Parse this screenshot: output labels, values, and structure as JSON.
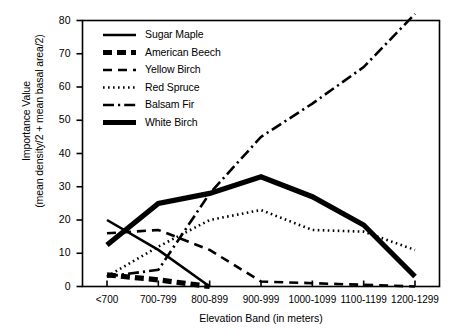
{
  "chart_data": {
    "type": "line",
    "title": "",
    "xlabel": "Elevation Band (in meters)",
    "ylabel_line1": "Importance Value",
    "ylabel_line2": "(mean density/2 + mean basal area/2)",
    "categories": [
      "<700",
      "700-799",
      "800-899",
      "900-999",
      "1000-1099",
      "1100-1199",
      "1200-1299"
    ],
    "ylim": [
      0,
      80
    ],
    "yticks": [
      0,
      10,
      20,
      30,
      40,
      50,
      60,
      70,
      80
    ],
    "grid": false,
    "legend_position": "top-left inside plot",
    "series": [
      {
        "name": "Sugar Maple",
        "style": "solid",
        "color": "#000000",
        "values": [
          20,
          11,
          0,
          null,
          null,
          null,
          null
        ]
      },
      {
        "name": "American Beech",
        "style": "thick-dashed",
        "color": "#000000",
        "values": [
          3.5,
          2,
          0,
          null,
          null,
          null,
          null
        ]
      },
      {
        "name": "Yellow Birch",
        "style": "dashed",
        "color": "#000000",
        "values": [
          16,
          17,
          11,
          1.5,
          1,
          0.5,
          0
        ]
      },
      {
        "name": "Red Spruce",
        "style": "dotted",
        "color": "#000000",
        "values": [
          3,
          12,
          20,
          23,
          17,
          16.5,
          11
        ]
      },
      {
        "name": "Balsam Fir",
        "style": "dash-dot",
        "color": "#000000",
        "values": [
          3,
          5,
          28,
          45,
          55,
          66,
          82
        ]
      },
      {
        "name": "White Birch",
        "style": "thick-solid",
        "color": "#000000",
        "values": [
          12.5,
          25,
          28,
          33,
          27,
          18.5,
          3
        ]
      }
    ]
  }
}
